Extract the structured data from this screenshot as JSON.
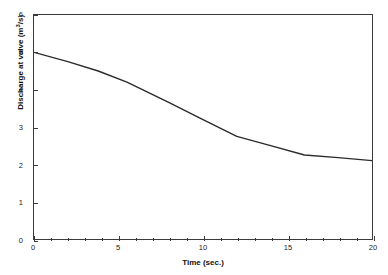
{
  "figure": {
    "top_cropped_text": "",
    "background_color": "#ffffff",
    "line_color": "#2b2b2b",
    "axis_color": "#3a3a3a"
  },
  "axes": {
    "y_tick_labels": [
      "0",
      "1",
      "2",
      "3",
      "4",
      "5",
      "6"
    ],
    "x_tick_labels": [
      "0",
      "5",
      "10",
      "15",
      "20"
    ],
    "y_title_main": "Discharge at valve (m",
    "y_title_sup": "3",
    "y_title_tail": "/s)",
    "x_title": "Time (sec.)"
  },
  "chart_data": {
    "type": "line",
    "title": "",
    "xlabel": "Time (sec.)",
    "ylabel": "Discharge at valve (m³/s)",
    "xlim": [
      0,
      20
    ],
    "ylim": [
      0,
      6
    ],
    "xticks": [
      0,
      5,
      10,
      15,
      20
    ],
    "yticks": [
      0,
      1,
      2,
      3,
      4,
      5,
      6
    ],
    "x_minor_tick_step": 1,
    "grid": false,
    "legend": false,
    "series": [
      {
        "name": "Discharge at valve",
        "x": [
          0,
          2,
          3.8,
          5.5,
          8,
          10,
          12,
          14,
          16,
          18,
          20
        ],
        "values": [
          5.0,
          4.75,
          4.5,
          4.2,
          3.65,
          3.2,
          2.75,
          2.5,
          2.25,
          2.18,
          2.1
        ]
      }
    ]
  }
}
